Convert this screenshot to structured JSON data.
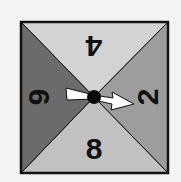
{
  "spinner": {
    "sections": [
      {
        "position": "top",
        "label": "4",
        "color": "#d3d3d3"
      },
      {
        "position": "right",
        "label": "2",
        "color": "#9d9d9d"
      },
      {
        "position": "bottom",
        "label": "8",
        "color": "#c1c1c1"
      },
      {
        "position": "left",
        "label": "6",
        "color": "#6b6b6b"
      }
    ],
    "arrow_points_to": "2",
    "outline_color": "#111111",
    "arrow_color": "#ffffff",
    "hub_color": "#0a0a0a"
  }
}
